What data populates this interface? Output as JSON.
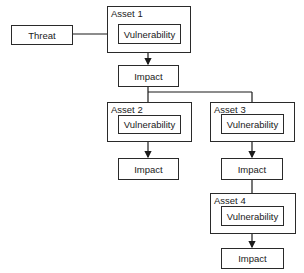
{
  "threat": {
    "label": "Threat"
  },
  "assets": [
    {
      "label": "Asset 1",
      "vulnerability": "Vulnerability",
      "impact": "Impact"
    },
    {
      "label": "Asset 2",
      "vulnerability": "Vulnerability",
      "impact": "Impact"
    },
    {
      "label": "Asset 3",
      "vulnerability": "Vulnerability",
      "impact": "Impact"
    },
    {
      "label": "Asset 4",
      "vulnerability": "Vulnerability",
      "impact": "Impact"
    }
  ]
}
